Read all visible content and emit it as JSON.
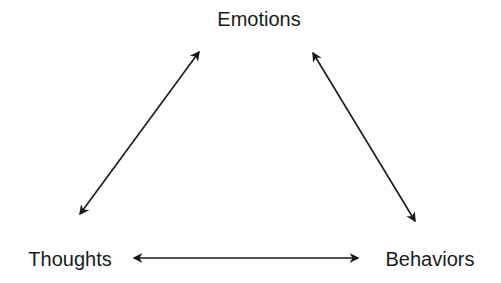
{
  "diagram": {
    "type": "cycle-triangle",
    "nodes": [
      {
        "id": "emotions",
        "label": "Emotions",
        "position": "top"
      },
      {
        "id": "thoughts",
        "label": "Thoughts",
        "position": "bottom-left"
      },
      {
        "id": "behaviors",
        "label": "Behaviors",
        "position": "bottom-right"
      }
    ],
    "edges": [
      {
        "from": "thoughts",
        "to": "emotions",
        "direction": "bidirectional"
      },
      {
        "from": "emotions",
        "to": "behaviors",
        "direction": "bidirectional"
      },
      {
        "from": "thoughts",
        "to": "behaviors",
        "direction": "bidirectional"
      }
    ],
    "colors": {
      "background": "#ffffff",
      "stroke": "#1a1a1a",
      "text": "#1a1a1a"
    }
  }
}
